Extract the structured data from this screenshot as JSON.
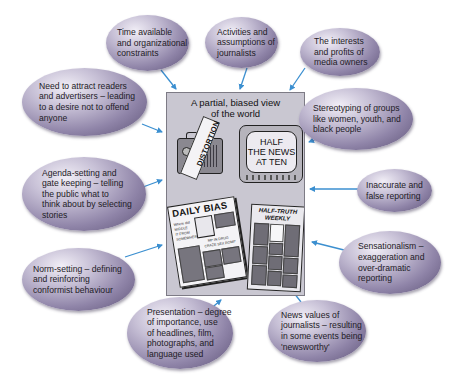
{
  "diagram": {
    "central_image": {
      "title_line1": "A partial, biased view",
      "title_line2": "of the world",
      "radio_ribbon": "DISTORTION",
      "tv_screen": [
        "HALF",
        "THE NEWS",
        "AT TEN"
      ],
      "newspaper_1": {
        "masthead": "DAILY BIAS",
        "snippets": [
          "Where did",
          "MIDDLE",
          "IT FROM",
          "SOMEWHERE",
          "MP IN DRUG",
          "CRAZE SEX ROMP"
        ]
      },
      "newspaper_2": {
        "masthead_line1": "HALF-TRUTH",
        "masthead_line2": "WEEKLY"
      }
    },
    "factors": [
      {
        "id": "time",
        "lines": [
          "Time available",
          "and organizational",
          "constraints"
        ]
      },
      {
        "id": "activities",
        "lines": [
          "Activities and",
          "assumptions of",
          "journalists"
        ]
      },
      {
        "id": "owners",
        "lines": [
          "The interests",
          "and  profits of",
          "media owners"
        ]
      },
      {
        "id": "readers",
        "lines": [
          "Need to attract readers",
          "and advertisers – leading",
          "to a desire not to offend",
          "anyone"
        ]
      },
      {
        "id": "stereotyping",
        "lines": [
          "Stereotyping of groups",
          "like women, youth, and",
          "black people"
        ]
      },
      {
        "id": "agenda",
        "lines": [
          "Agenda-setting and",
          "gate keeping – telling",
          "the public what to",
          "think about by selecting",
          "stories"
        ]
      },
      {
        "id": "inaccurate",
        "lines": [
          "Inaccurate and",
          "false reporting"
        ]
      },
      {
        "id": "sensationalism",
        "lines": [
          "Sensationalism –",
          "exaggeration and",
          "over-dramatic",
          "reporting"
        ]
      },
      {
        "id": "norm",
        "lines": [
          "Norm-setting – defining",
          "and reinforcing",
          "conformist behaviour"
        ]
      },
      {
        "id": "presentation",
        "lines": [
          "Presentation – degree",
          "of importance, use",
          "of headlines, film,",
          "photographs, and",
          "language used"
        ]
      },
      {
        "id": "newsvalues",
        "lines": [
          "News values of",
          "journalists – resulting",
          "in some events being",
          "'newsworthy'"
        ]
      }
    ],
    "colors": {
      "arrow": "#3b8fd0",
      "bubble_light": "#f1eef6",
      "bubble_dark": "#5d5276",
      "box_fill": "#c9c7d1",
      "text": "#1e1b26"
    }
  }
}
